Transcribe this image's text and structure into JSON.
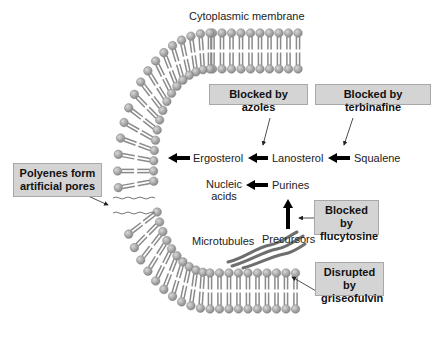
{
  "title": "Cytoplasmic membrane",
  "molecules": {
    "ergosterol": "Ergosterol",
    "lanosterol": "Lanosterol",
    "squalene": "Squalene",
    "nucleic_acids_line1": "Nucleic",
    "nucleic_acids_line2": "acids",
    "purines": "Purines",
    "precursors": "Precursors",
    "microtubules": "Microtubules"
  },
  "callouts": {
    "azoles": "Blocked by azoles",
    "terbinafine": "Blocked by terbinafine",
    "flucytosine_line1": "Blocked by",
    "flucytosine_line2": "flucytosine",
    "polyenes_line1": "Polyenes form",
    "polyenes_line2": "artificial pores",
    "griseofulvin_line1": "Disrupted by",
    "griseofulvin_line2": "griseofulvin"
  },
  "colors": {
    "callout_fill": "#d4d4d4",
    "callout_border": "#a8a8a8",
    "lipid_head": "#9a9a9a",
    "lipid_tail": "#8a8a8a",
    "arrow": "#000000",
    "microtubule": "#6e6e6e"
  }
}
